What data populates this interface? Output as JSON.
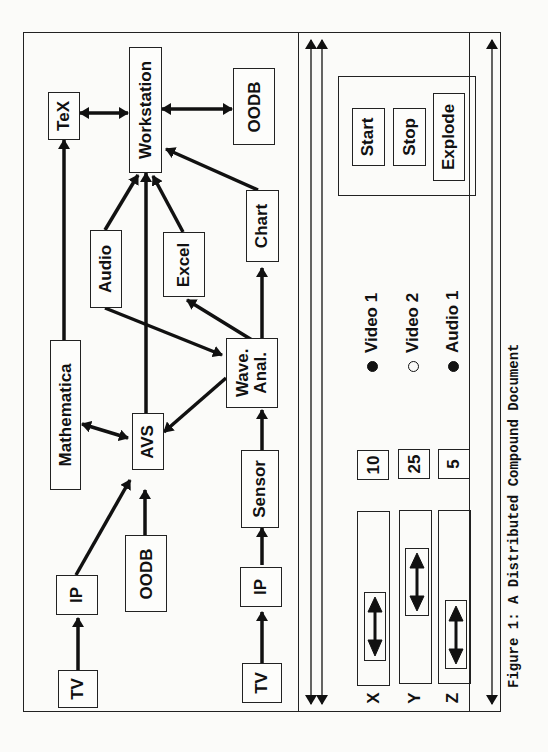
{
  "page_number": "2??",
  "figure": {
    "caption": "Figure 1: A Distributed Compound Document",
    "orientation": "rotated 90deg counter-clockwise"
  },
  "diagram": {
    "nodes": [
      {
        "id": "tv1",
        "label": "TV"
      },
      {
        "id": "ip1",
        "label": "IP"
      },
      {
        "id": "oodb1",
        "label": "OODB"
      },
      {
        "id": "mathematica",
        "label": "Mathematica"
      },
      {
        "id": "avs",
        "label": "AVS"
      },
      {
        "id": "tex",
        "label": "TeX"
      },
      {
        "id": "workstation",
        "label": "Workstation"
      },
      {
        "id": "oodb2",
        "label": "OODB"
      },
      {
        "id": "audio",
        "label": "Audio"
      },
      {
        "id": "excel",
        "label": "Excel"
      },
      {
        "id": "chart",
        "label": "Chart"
      },
      {
        "id": "wave",
        "label": "Wave.\nAnal."
      },
      {
        "id": "sensor",
        "label": "Sensor"
      },
      {
        "id": "ip2",
        "label": "IP"
      },
      {
        "id": "tv2",
        "label": "TV"
      }
    ],
    "edges": [
      {
        "from": "tv1",
        "to": "ip1",
        "type": "directed"
      },
      {
        "from": "ip1",
        "to": "avs",
        "type": "directed"
      },
      {
        "from": "oodb1",
        "to": "avs",
        "type": "directed"
      },
      {
        "from": "mathematica",
        "to": "avs",
        "type": "bidirectional"
      },
      {
        "from": "mathematica",
        "to": "tex",
        "type": "directed"
      },
      {
        "from": "tex",
        "to": "workstation",
        "type": "bidirectional"
      },
      {
        "from": "workstation",
        "to": "oodb2",
        "type": "bidirectional"
      },
      {
        "from": "avs",
        "to": "workstation",
        "type": "directed"
      },
      {
        "from": "audio",
        "to": "workstation",
        "type": "directed"
      },
      {
        "from": "excel",
        "to": "workstation",
        "type": "directed"
      },
      {
        "from": "chart",
        "to": "workstation",
        "type": "directed"
      },
      {
        "from": "audio",
        "to": "wave",
        "type": "directed"
      },
      {
        "from": "wave",
        "to": "excel",
        "type": "directed"
      },
      {
        "from": "wave",
        "to": "chart",
        "type": "directed"
      },
      {
        "from": "wave",
        "to": "avs",
        "type": "directed"
      },
      {
        "from": "sensor",
        "to": "wave",
        "type": "directed"
      },
      {
        "from": "ip2",
        "to": "sensor",
        "type": "directed"
      },
      {
        "from": "tv2",
        "to": "ip2",
        "type": "directed"
      }
    ]
  },
  "controls": {
    "sliders": [
      {
        "axis": "X",
        "value": "10"
      },
      {
        "axis": "Y",
        "value": "25"
      },
      {
        "axis": "Z",
        "value": "5"
      }
    ],
    "channels": [
      {
        "label": "Video 1",
        "selected": true
      },
      {
        "label": "Video 2",
        "selected": false
      },
      {
        "label": "Audio 1",
        "selected": true
      }
    ],
    "buttons": [
      {
        "label": "Start"
      },
      {
        "label": "Stop"
      },
      {
        "label": "Explode"
      }
    ]
  }
}
